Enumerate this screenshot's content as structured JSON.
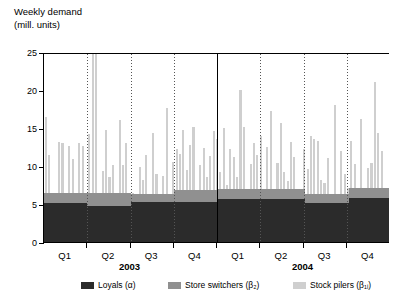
{
  "chart_data": {
    "type": "bar",
    "stacked": true,
    "title": "Weekly demand",
    "subtitle": "(mill. units)",
    "ylabel": "",
    "xlabel": "",
    "ylim": [
      0,
      25
    ],
    "yticks": [
      0,
      5,
      10,
      15,
      20,
      25
    ],
    "grid": false,
    "legend_position": "bottom",
    "clipped_note": "Two bars in Q2 2003 exceed the 25 axis maximum and are clipped",
    "series": [
      {
        "name": "Loyals (α)",
        "color": "#2b2b2b",
        "key": "loyals"
      },
      {
        "name": "Store switchers (β₂)",
        "color": "#909090",
        "key": "switchers"
      },
      {
        "name": "Stock pilers (β₁ᵢ)",
        "color": "#cfcfcf",
        "key": "pilers"
      }
    ],
    "year_groups": [
      {
        "label": "2003",
        "quarters": [
          "Q1",
          "Q2",
          "Q3",
          "Q4"
        ]
      },
      {
        "label": "2004",
        "quarters": [
          "Q1",
          "Q2",
          "Q3",
          "Q4"
        ]
      }
    ],
    "quarter_baselines": [
      {
        "year": "2003",
        "quarter": "Q1",
        "loyals": 5.1,
        "switchers": 1.3
      },
      {
        "year": "2003",
        "quarter": "Q2",
        "loyals": 4.8,
        "switchers": 1.6
      },
      {
        "year": "2003",
        "quarter": "Q3",
        "loyals": 5.2,
        "switchers": 1.1
      },
      {
        "year": "2003",
        "quarter": "Q4",
        "loyals": 5.3,
        "switchers": 1.5
      },
      {
        "year": "2004",
        "quarter": "Q1",
        "loyals": 5.6,
        "switchers": 1.4
      },
      {
        "year": "2004",
        "quarter": "Q2",
        "loyals": 5.6,
        "switchers": 1.4
      },
      {
        "year": "2004",
        "quarter": "Q3",
        "loyals": 5.1,
        "switchers": 1.2
      },
      {
        "year": "2004",
        "quarter": "Q4",
        "loyals": 5.8,
        "switchers": 1.3
      }
    ],
    "weekly_totals": [
      16.4,
      11.5,
      6.4,
      6.4,
      13.2,
      13.0,
      6.4,
      12.6,
      10.9,
      6.4,
      13.0,
      12.6,
      6.4,
      14.2,
      27.0,
      27.0,
      6.4,
      9.4,
      14.8,
      8.5,
      10.1,
      6.4,
      16.0,
      10.2,
      13.0,
      6.4,
      6.4,
      6.3,
      9.9,
      8.2,
      11.5,
      6.3,
      14.4,
      9.0,
      6.3,
      8.7,
      17.6,
      6.3,
      10.5,
      12.3,
      11.6,
      14.7,
      9.5,
      12.8,
      15.1,
      6.8,
      10.2,
      12.4,
      8.6,
      11.3,
      14.6,
      13.6,
      9.2,
      15.0,
      7.5,
      12.2,
      11.2,
      8.6,
      20.0,
      15.2,
      7.0,
      10.3,
      13.0,
      11.5,
      14.0,
      7.0,
      12.5,
      17.3,
      7.0,
      10.4,
      15.6,
      9.2,
      8.0,
      13.1,
      11.2,
      7.0,
      6.3,
      12.3,
      9.6,
      14.0,
      13.6,
      13.3,
      8.2,
      7.8,
      11.0,
      6.3,
      18.0,
      6.3,
      12.0,
      9.0,
      7.1,
      13.3,
      10.3,
      7.1,
      16.2,
      7.1,
      9.8,
      10.4,
      21.0,
      14.3,
      12.0,
      7.1,
      7.1
    ]
  },
  "axis": {
    "y_tick_labels": [
      "25",
      "20",
      "15",
      "10",
      "5",
      "0"
    ]
  }
}
